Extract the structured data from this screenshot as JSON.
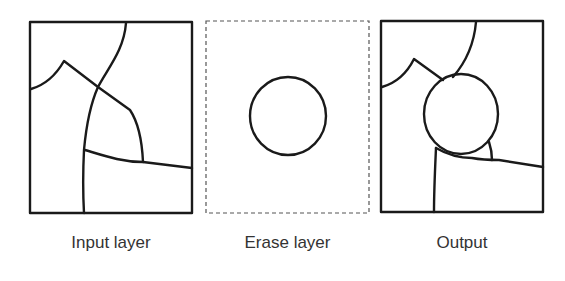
{
  "panels": [
    {
      "id": "input",
      "label": "Input layer",
      "frame_style": "solid"
    },
    {
      "id": "erase",
      "label": "Erase layer",
      "frame_style": "dashed"
    },
    {
      "id": "output",
      "label": "Output",
      "frame_style": "solid"
    }
  ],
  "colors": {
    "stroke": "#1a1a1a",
    "label": "#333333",
    "dashed_frame": "#555555",
    "background": "#ffffff"
  }
}
